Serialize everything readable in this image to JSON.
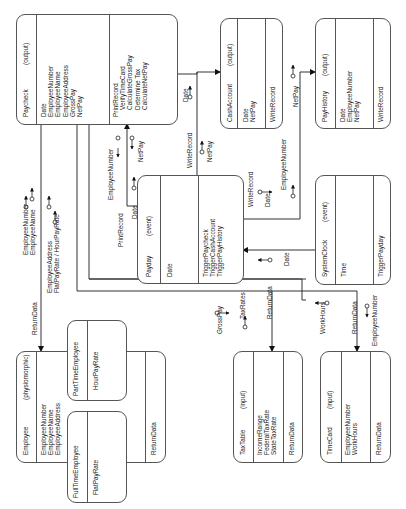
{
  "diagram": {
    "type": "object-oriented class/message diagram (rotated 90°)",
    "objects": {
      "paycheck": {
        "name": "Paycheck",
        "stereotype": "(output)",
        "attributes": "Date\nEmployeeNumber\nEmployeeName\nEmployeeAddress\nGrossPay\nNetPay",
        "methods": "PrintRecord\n    VerifyTimeCard\n    CalculateGrossPay\n    Determine Tax\n    CalculateNetPay"
      },
      "cash_account": {
        "name": "CashAccount",
        "stereotype": "(output)",
        "attributes": "Date\nNetPay",
        "methods": "WriteRecord"
      },
      "pay_history": {
        "name": "PayHistory",
        "stereotype": "(output)",
        "attributes": "Date\nEmployeeNumber\nNetPay",
        "methods": "WriteRecord"
      },
      "payday": {
        "name": "Payday",
        "stereotype": "(event)",
        "attributes": "Date",
        "methods": "TriggerPaycheck\nTriggerCashAccount\nTriggerPayHistory"
      },
      "system_clock": {
        "name": "SystemClock",
        "stereotype": "(event)",
        "attributes": "Time",
        "methods": "TriggerPayday"
      },
      "employee": {
        "name": "Employee",
        "stereotype": "(physiomorphic)",
        "attributes": "EmployeeNumber\nEmployeeName\nEmployeeAddress",
        "methods": "ReturnData"
      },
      "part_time_employee": {
        "name": "PartTimeEmployee",
        "attributes": "HourPayRate"
      },
      "full_time_employee": {
        "name": "FullTimeEmployee",
        "attributes": "FlatPayRate"
      },
      "tax_table": {
        "name": "TaxTable",
        "stereotype": "(input)",
        "attributes": "IncomeRange\nFederalTaxRate\nStateTaxRate",
        "methods": "ReturnData"
      },
      "time_card": {
        "name": "TimeCard",
        "stereotype": "(input)",
        "attributes": "EmployeeNumber\nWorkHours",
        "methods": "ReturnData"
      }
    },
    "messages": {
      "paycheck_to_employee": {
        "message": "ReturnData",
        "data_out": "EmployeeNumber\nEmployeeName",
        "data_back": "EmployeeAddress\nFlatPayRate / HourPayRate"
      },
      "payday_to_paycheck": {
        "message": "PrintRecord",
        "data": "Date",
        "return_1": "EmployeeNumber",
        "return_2": "NetPay"
      },
      "paycheck_to_cashaccount": {
        "message": "WriteRecord",
        "data": "Date",
        "data_2": "NetPay"
      },
      "payday_to_payhistory": {
        "message": "WriteRecord",
        "data": "Date",
        "data_2": "EmployeeNumber",
        "data_3": "NetPay"
      },
      "systemclock_to_payday": {
        "data": "Date"
      },
      "paycheck_to_taxtable": {
        "message": "ReturnData",
        "data_out": "GrossPay",
        "data_back": "TaxRates"
      },
      "paycheck_to_timecard": {
        "message": "ReturnData",
        "data_back": "WorkHours",
        "data_out": "EmployeeNumber"
      }
    }
  }
}
